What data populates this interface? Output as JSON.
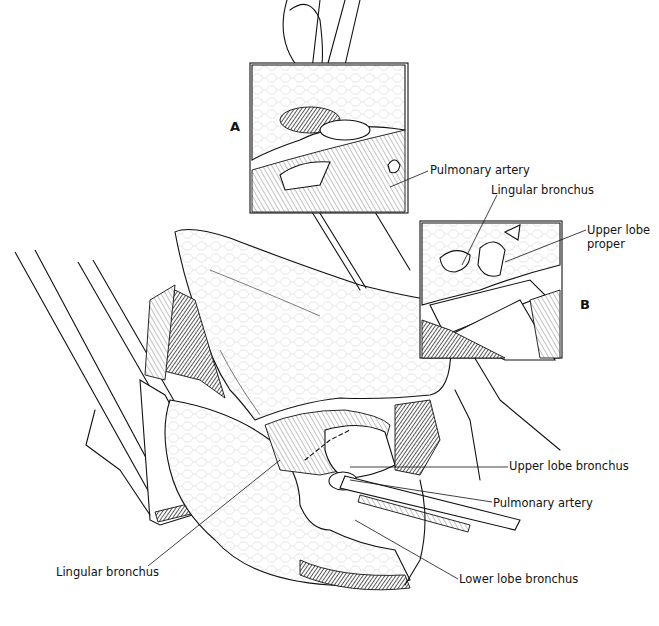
{
  "figure": {
    "type": "surgical-illustration",
    "colors": {
      "ink": "#111111",
      "background": "#ffffff"
    }
  },
  "panels": {
    "inset_a": {
      "letter": "A"
    },
    "inset_b": {
      "letter": "B"
    }
  },
  "labels": {
    "inset_a_pulmonary_artery": "Pulmonary artery",
    "inset_b_lingular_bronchus": "Lingular bronchus",
    "inset_b_upper_lobe_proper_line1": "Upper lobe",
    "inset_b_upper_lobe_proper_line2": "proper",
    "main_upper_lobe_bronchus": "Upper lobe bronchus",
    "main_pulmonary_artery": "Pulmonary artery",
    "main_lower_lobe_bronchus": "Lower lobe bronchus",
    "main_lingular_bronchus": "Lingular bronchus"
  }
}
